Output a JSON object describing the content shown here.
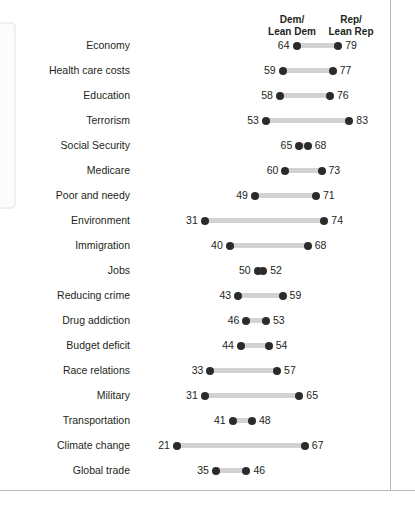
{
  "headers": {
    "left_line1": "Dem/",
    "left_line2": "Lean Dem",
    "right_line1": "Rep/",
    "right_line2": "Lean Rep"
  },
  "style": {
    "dot_color": "#2b2b2b",
    "connector_color": "#d2d2d2",
    "text_color": "#231f20",
    "frame_color": "#b9b9b9"
  },
  "chart_data": {
    "type": "bar",
    "chart_subtype": "dumbbell",
    "title": "",
    "subtitle": "",
    "xlabel": "",
    "ylabel": "",
    "xlim": [
      0,
      100
    ],
    "grid": false,
    "legend_position": "top",
    "categories": [
      "Economy",
      "Health care costs",
      "Education",
      "Terrorism",
      "Social Security",
      "Medicare",
      "Poor and needy",
      "Environment",
      "Immigration",
      "Jobs",
      "Reducing crime",
      "Drug addiction",
      "Budget deficit",
      "Race relations",
      "Military",
      "Transportation",
      "Climate change",
      "Global trade"
    ],
    "series": [
      {
        "name": "Dem/Lean Dem",
        "values": [
          64,
          59,
          58,
          53,
          65,
          60,
          49,
          31,
          40,
          50,
          43,
          46,
          44,
          33,
          31,
          41,
          21,
          35
        ]
      },
      {
        "name": "Rep/Lean Rep",
        "values": [
          79,
          77,
          76,
          83,
          68,
          73,
          71,
          74,
          68,
          52,
          59,
          53,
          54,
          57,
          65,
          48,
          67,
          46
        ]
      }
    ]
  }
}
